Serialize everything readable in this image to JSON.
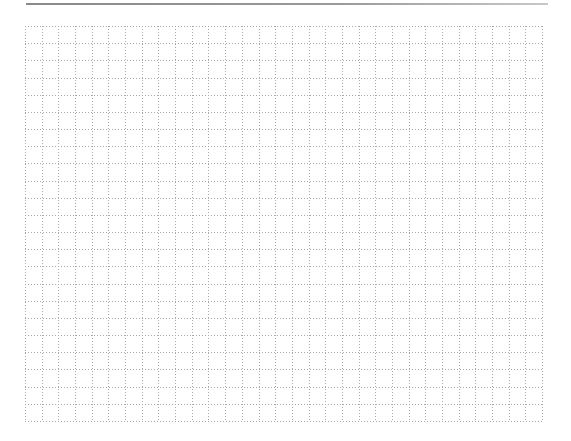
{
  "page": {
    "type": "graph-paper",
    "background_color": "#ffffff"
  },
  "header_rule": {
    "color": "#8a8a8a"
  },
  "grid": {
    "columns": 31,
    "rows": 23,
    "cell_width": 16.68,
    "cell_height": 17.17,
    "line_color": "#a8a8a8",
    "line_style": "dotted"
  }
}
